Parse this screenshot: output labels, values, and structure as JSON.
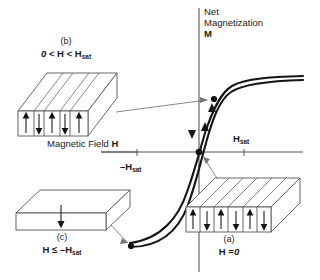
{
  "figure": {
    "kind": "magnetic-hysteresis-domain-diagram",
    "axes": {
      "y_axis_label_line1": "Net",
      "y_axis_label_line2": "Magnetization",
      "y_axis_symbol": "M",
      "x_axis_label": "Magnetic Field",
      "x_axis_symbol": "H",
      "tick_positive_label": "H",
      "tick_positive_sub": "sat",
      "tick_negative_prefix": "–",
      "tick_negative_label": "H",
      "tick_negative_sub": "sat"
    },
    "panels": [
      {
        "id": "b",
        "tag": "(b)",
        "condition_html": "0 < H < H_sat",
        "condition_parts": {
          "zero": "0",
          "lt1": "<",
          "h1": "H",
          "lt2": "<",
          "h2": "H",
          "sub2": "sat"
        },
        "domains": [
          "up",
          "down",
          "up",
          "down",
          "up"
        ],
        "domain_widths": [
          18,
          11,
          18,
          11,
          18
        ],
        "description": "partially aligned domains, field applied below saturation"
      },
      {
        "id": "a",
        "tag": "(a)",
        "condition_parts": {
          "h1": "H",
          "eq": "=",
          "zero": "0"
        },
        "domains": [
          "up",
          "down",
          "up",
          "down",
          "up",
          "down"
        ],
        "domain_widths": [
          15,
          15,
          15,
          15,
          15,
          15
        ],
        "description": "randomly oriented equal domains, zero net magnetization"
      },
      {
        "id": "c",
        "tag": "(c)",
        "condition_parts": {
          "h1": "H",
          "le": "≤",
          "minus": "–",
          "h2": "H",
          "sub2": "sat"
        },
        "domains": [
          "down"
        ],
        "domain_widths": [
          82
        ],
        "description": "single domain saturated in negative direction"
      }
    ],
    "curve": {
      "type": "hysteresis-loop",
      "branch_up_direction": "upward-right",
      "branch_down_direction": "downward-left",
      "markers": [
        {
          "name": "origin-point",
          "x": 199,
          "y": 152
        },
        {
          "name": "upper-branch-point",
          "x": 213,
          "y": 99
        },
        {
          "name": "lower-saturation-point",
          "x": 130,
          "y": 247
        }
      ]
    },
    "colors": {
      "line": "#1a1a1a",
      "axis": "#4d4d4d",
      "leader": "#666666",
      "block_fill": "#ffffff",
      "block_stroke": "#4d4d4d",
      "background": "#ffffff"
    }
  }
}
